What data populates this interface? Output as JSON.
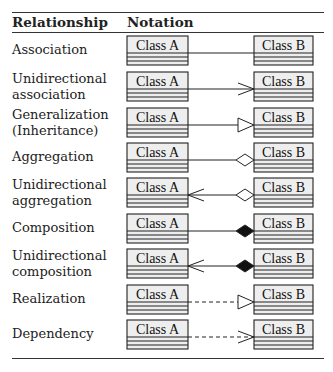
{
  "table": {
    "headers": {
      "relationship": "Relationship",
      "notation": "Notation"
    },
    "class_a_label": "Class A",
    "class_b_label": "Class B",
    "rows": [
      {
        "label_lines": [
          "Association"
        ],
        "line": "solid",
        "end_b": "none",
        "end_a": "none"
      },
      {
        "label_lines": [
          "Unidirectional",
          "association"
        ],
        "line": "solid",
        "end_b": "open-arrow",
        "end_a": "none"
      },
      {
        "label_lines": [
          "Generalization",
          "(Inheritance)"
        ],
        "line": "solid",
        "end_b": "hollow-triangle",
        "end_a": "none"
      },
      {
        "label_lines": [
          "Aggregation"
        ],
        "line": "solid",
        "end_b": "hollow-diamond",
        "end_a": "none"
      },
      {
        "label_lines": [
          "Unidirectional",
          "aggregation"
        ],
        "line": "solid",
        "end_b": "hollow-diamond",
        "end_a": "open-arrow"
      },
      {
        "label_lines": [
          "Composition"
        ],
        "line": "solid",
        "end_b": "filled-diamond",
        "end_a": "none"
      },
      {
        "label_lines": [
          "Unidirectional",
          "composition"
        ],
        "line": "solid",
        "end_b": "filled-diamond",
        "end_a": "open-arrow"
      },
      {
        "label_lines": [
          "Realization"
        ],
        "line": "dashed",
        "end_b": "hollow-triangle",
        "end_a": "none"
      },
      {
        "label_lines": [
          "Dependency"
        ],
        "line": "dashed",
        "end_b": "open-arrow",
        "end_a": "none"
      }
    ]
  },
  "colors": {
    "box_fill": "#eeeeee",
    "stroke": "#222222",
    "rule": "#333333"
  }
}
